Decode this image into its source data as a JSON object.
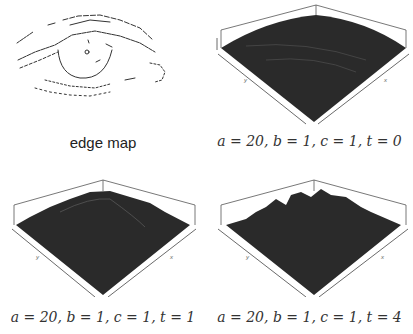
{
  "panels": [
    {
      "id": "edge-map",
      "caption": "edge map",
      "type": "edge-map-image"
    },
    {
      "id": "surface-t0",
      "caption": "a = 20, b = 1, c = 1, t = 0",
      "type": "3d-surface",
      "axes": {
        "left": "y",
        "right": "x"
      },
      "params": {
        "a": 20,
        "b": 1,
        "c": 1,
        "t": 0
      }
    },
    {
      "id": "surface-t1",
      "caption": "a = 20, b = 1, c = 1, t = 1",
      "type": "3d-surface",
      "axes": {
        "left": "y",
        "right": "x"
      },
      "params": {
        "a": 20,
        "b": 1,
        "c": 1,
        "t": 1
      }
    },
    {
      "id": "surface-t4",
      "caption": "a = 20, b = 1, c = 1, t = 4",
      "type": "3d-surface",
      "axes": {
        "left": "y",
        "right": "x"
      },
      "params": {
        "a": 20,
        "b": 1,
        "c": 1,
        "t": 4
      }
    }
  ],
  "colors": {
    "surface": "#2a2a2a",
    "background": "#ffffff",
    "line": "#333333"
  }
}
